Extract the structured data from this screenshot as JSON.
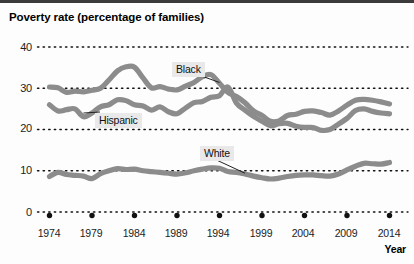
{
  "chart_data": {
    "type": "line",
    "title": "Poverty rate (percentage of families)",
    "xlabel": "Year",
    "ylabel": "",
    "xlim": [
      1974,
      2014
    ],
    "ylim": [
      0,
      40
    ],
    "ytick_labels": [
      "0",
      "10",
      "20",
      "30",
      "40"
    ],
    "yticks": [
      0,
      10,
      20,
      30,
      40
    ],
    "xtick_labels": [
      "1974",
      "1979",
      "1984",
      "1989",
      "1994",
      "1999",
      "2004",
      "2009",
      "2014"
    ],
    "xticks": [
      1974,
      1979,
      1984,
      1989,
      1994,
      1999,
      2004,
      2009,
      2014
    ],
    "grid": "horizontal-dotted",
    "legend": "inline-callout-labels",
    "line_color": "#8c8c8c",
    "x": [
      1974,
      1975,
      1976,
      1977,
      1978,
      1979,
      1980,
      1981,
      1982,
      1983,
      1984,
      1985,
      1986,
      1987,
      1988,
      1989,
      1990,
      1991,
      1992,
      1993,
      1994,
      1995,
      1996,
      1997,
      1998,
      1999,
      2000,
      2001,
      2002,
      2003,
      2004,
      2005,
      2006,
      2007,
      2008,
      2009,
      2010,
      2011,
      2012,
      2013,
      2014
    ],
    "series": [
      {
        "name": "Black",
        "values": [
          30.3,
          30.1,
          29.0,
          29.3,
          29.1,
          29.5,
          30.0,
          32.0,
          34.2,
          35.2,
          35.1,
          32.5,
          30.1,
          30.4,
          29.8,
          29.6,
          30.5,
          31.4,
          32.8,
          33.3,
          31.2,
          29.0,
          28.0,
          26.5,
          24.5,
          23.4,
          22.0,
          22.1,
          23.4,
          23.7,
          24.4,
          24.5,
          24.1,
          23.5,
          24.5,
          25.9,
          27.1,
          27.3,
          27.1,
          26.7,
          26.2
        ]
      },
      {
        "name": "Hispanic",
        "values": [
          26.0,
          24.5,
          24.8,
          25.0,
          23.1,
          24.0,
          25.5,
          26.0,
          27.2,
          27.0,
          26.0,
          25.7,
          24.7,
          25.5,
          24.3,
          23.8,
          25.2,
          26.5,
          26.8,
          27.8,
          28.2,
          30.3,
          26.4,
          24.7,
          23.2,
          22.0,
          20.9,
          21.4,
          21.5,
          20.8,
          20.5,
          20.5,
          19.8,
          20.0,
          21.3,
          22.7,
          24.6,
          25.0,
          24.4,
          24.0,
          23.8
        ]
      },
      {
        "name": "White",
        "values": [
          8.6,
          9.6,
          9.1,
          8.9,
          8.7,
          8.1,
          9.3,
          10.0,
          10.5,
          10.3,
          10.4,
          10.0,
          9.8,
          9.6,
          9.4,
          9.2,
          9.5,
          10.0,
          10.4,
          10.7,
          10.6,
          9.8,
          9.6,
          9.2,
          8.7,
          8.3,
          8.0,
          8.2,
          8.6,
          8.9,
          9.0,
          9.0,
          8.8,
          8.7,
          9.2,
          10.2,
          11.1,
          11.8,
          11.7,
          11.6,
          12.0
        ]
      }
    ],
    "annotations": [
      {
        "label": "Black",
        "points_to_series": "Black",
        "at_year": 1994
      },
      {
        "label": "Hispanic",
        "points_to_series": "Hispanic",
        "at_year": 1979
      },
      {
        "label": "White",
        "points_to_series": "White",
        "at_year": 1997
      }
    ]
  }
}
